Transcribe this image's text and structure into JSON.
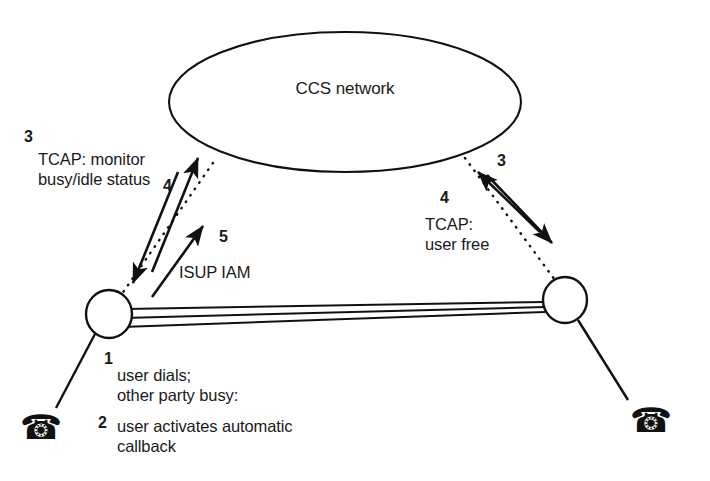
{
  "figure": {
    "name": "automatic-callback-ccs-signaling-diagram",
    "background_color": "#ffffff",
    "ink_color": "#111111"
  },
  "network": {
    "label": "CCS network",
    "shape": "ellipse"
  },
  "nodes": {
    "left_switch": {
      "name": "originating-switch",
      "shape": "circle"
    },
    "right_switch": {
      "name": "terminating-switch",
      "shape": "circle"
    },
    "left_phone": {
      "icon": "telephone-icon",
      "glyph": "☎"
    },
    "right_phone": {
      "icon": "telephone-icon",
      "glyph": "☎"
    }
  },
  "links": {
    "trunk_group": {
      "name": "trunk-group",
      "line_count": 3,
      "style": "solid"
    },
    "left_signaling_link": {
      "name": "signaling-link-left",
      "style": "dotted"
    },
    "right_signaling_link": {
      "name": "signaling-link-right",
      "style": "dotted"
    }
  },
  "steps": {
    "step1": {
      "number": "1",
      "text_line1": "user dials;",
      "text_line2": "other party busy:"
    },
    "step2": {
      "number": "2",
      "text_line1": "user activates automatic",
      "text_line2": "callback"
    },
    "step3_left": {
      "number": "3",
      "text_line1": "TCAP: monitor",
      "text_line2": "busy/idle status"
    },
    "step4_left": {
      "number": "4"
    },
    "step5": {
      "number": "5",
      "text": "ISUP IAM"
    },
    "step3_right": {
      "number": "3"
    },
    "step4_right": {
      "number": "4",
      "text_line1": "TCAP:",
      "text_line2": "user free"
    }
  }
}
